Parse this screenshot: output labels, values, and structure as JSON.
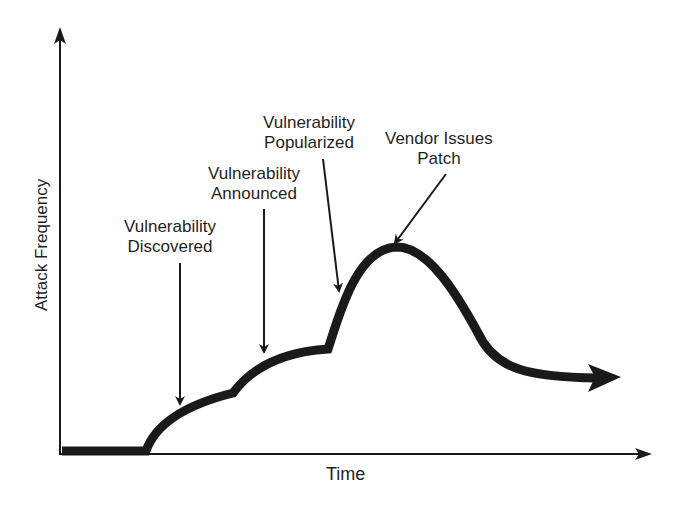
{
  "diagram": {
    "title": "",
    "axes": {
      "y_label": "Attack Frequency",
      "x_label": "Time"
    },
    "annotations": [
      {
        "id": "discovered",
        "line1": "Vulnerability",
        "line2": "Discovered"
      },
      {
        "id": "announced",
        "line1": "Vulnerability",
        "line2": "Announced"
      },
      {
        "id": "popularized",
        "line1": "Vulnerability",
        "line2": "Popularized"
      },
      {
        "id": "patch",
        "line1": "Vendor Issues",
        "line2": "Patch"
      }
    ],
    "curve_description": "Attack frequency flat at zero, rises after discovery, steps up at announcement, rises sharply after popularization, peaks at vendor patch, then declines to a lower sustained level",
    "colors": {
      "ink": "#1a1a1a",
      "background": "#ffffff"
    }
  }
}
